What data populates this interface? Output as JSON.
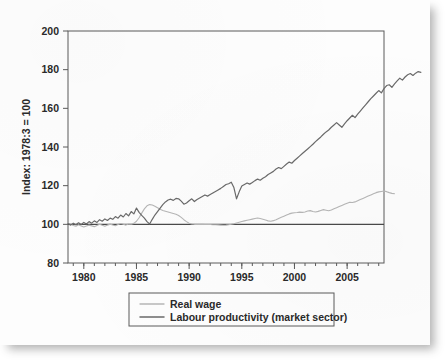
{
  "chart_data": {
    "type": "line",
    "title": "",
    "subtitle": "",
    "xlabel": "",
    "ylabel": "Index: 1978:3 = 100",
    "xlim": [
      1978.5,
      2008.5
    ],
    "ylim": [
      80,
      200
    ],
    "ytick_values": [
      80,
      100,
      120,
      140,
      160,
      180,
      200
    ],
    "ytick_labels": [
      "80",
      "100",
      "120",
      "140",
      "160",
      "180",
      "200"
    ],
    "xtick_values": [
      1980,
      1985,
      1990,
      1995,
      2000,
      2005
    ],
    "xtick_labels": [
      "1980",
      "1985",
      "1990",
      "1995",
      "2000",
      "2005"
    ],
    "x_minor_step": 1,
    "grid": false,
    "legend_position": "below-center",
    "reference_line": {
      "y": 100,
      "label": "100",
      "color": "#4a4a4a"
    },
    "colors": {
      "real_wage": "#b6b6b6",
      "labour_productivity": "#6a6a6a",
      "axis": "#5a5a5a",
      "text": "#2a2a2a",
      "page": "#fdfdfd"
    },
    "x_start": 1978.5,
    "x_step": 0.25,
    "series": [
      {
        "name": "Real wage",
        "color": "#b6b6b6",
        "width": 1.1,
        "values": [
          100.6,
          100.2,
          99.4,
          99.0,
          99.8,
          99.2,
          98.6,
          99.1,
          99.6,
          99.2,
          98.8,
          99.4,
          100.0,
          99.5,
          99.0,
          99.6,
          100.1,
          99.7,
          99.3,
          99.9,
          100.4,
          100.0,
          99.6,
          100.2,
          100.0,
          100.5,
          101.6,
          103.4,
          105.8,
          108.0,
          109.6,
          110.2,
          110.0,
          109.4,
          108.6,
          107.8,
          107.2,
          106.8,
          106.4,
          106.0,
          105.6,
          105.2,
          104.6,
          103.6,
          102.4,
          101.4,
          100.6,
          100.2,
          100.0,
          100.0,
          100.0,
          100.0,
          99.9,
          99.9,
          99.9,
          99.8,
          99.8,
          99.7,
          99.6,
          99.5,
          99.6,
          99.8,
          100.0,
          100.3,
          100.7,
          101.1,
          101.5,
          101.8,
          102.1,
          102.4,
          102.7,
          103.0,
          103.3,
          103.0,
          102.6,
          102.2,
          101.8,
          101.6,
          101.9,
          102.4,
          103.0,
          103.6,
          104.2,
          104.8,
          105.4,
          105.8,
          106.0,
          106.1,
          106.3,
          106.2,
          106.4,
          106.9,
          107.1,
          106.6,
          106.4,
          106.7,
          107.2,
          107.6,
          107.3,
          107.0,
          107.4,
          108.0,
          108.6,
          109.2,
          109.8,
          110.4,
          110.9,
          111.4,
          111.3,
          111.6,
          112.2,
          112.8,
          113.4,
          114.0,
          114.6,
          115.2,
          115.8,
          116.4,
          116.8,
          117.0,
          117.2,
          116.9,
          116.4,
          116.0,
          115.8
        ]
      },
      {
        "name": "Labour productivity (market sector)",
        "color": "#6a6a6a",
        "width": 1.2,
        "values": [
          100.4,
          99.6,
          100.6,
          99.8,
          100.8,
          99.9,
          101.0,
          100.2,
          101.4,
          100.6,
          101.8,
          101.0,
          102.4,
          101.6,
          102.8,
          102.0,
          103.2,
          102.6,
          104.0,
          103.2,
          104.8,
          103.8,
          105.6,
          104.4,
          106.6,
          105.4,
          108.4,
          106.2,
          104.6,
          103.2,
          101.4,
          100.2,
          102.6,
          104.8,
          106.6,
          108.4,
          110.2,
          111.6,
          112.6,
          113.0,
          112.4,
          113.4,
          113.2,
          112.0,
          110.4,
          111.0,
          112.2,
          113.2,
          111.8,
          112.8,
          113.6,
          114.4,
          115.2,
          114.6,
          115.4,
          116.2,
          117.0,
          117.8,
          118.6,
          119.6,
          120.6,
          121.0,
          121.8,
          119.0,
          113.2,
          116.8,
          119.8,
          120.6,
          121.4,
          120.8,
          121.6,
          122.6,
          123.4,
          122.8,
          123.8,
          124.6,
          125.8,
          126.6,
          127.4,
          128.6,
          129.4,
          128.8,
          130.0,
          131.2,
          132.2,
          131.6,
          133.0,
          134.2,
          135.4,
          136.6,
          137.8,
          139.0,
          140.2,
          141.4,
          142.8,
          144.0,
          145.2,
          146.6,
          147.8,
          148.8,
          150.2,
          151.4,
          152.6,
          151.4,
          150.2,
          152.0,
          153.6,
          155.0,
          156.4,
          155.2,
          157.0,
          158.6,
          160.2,
          161.8,
          163.4,
          165.0,
          166.4,
          167.8,
          169.2,
          168.0,
          170.2,
          171.8,
          172.2,
          170.8,
          172.6,
          174.2,
          175.6,
          174.6,
          176.2,
          177.4,
          178.0,
          177.0,
          178.2,
          179.0,
          178.6
        ]
      }
    ]
  },
  "legend": {
    "items": [
      {
        "label": "Real wage"
      },
      {
        "label": "Labour productivity (market sector)"
      }
    ]
  },
  "axes": {
    "y_title": "Index: 1978:3 = 100"
  }
}
